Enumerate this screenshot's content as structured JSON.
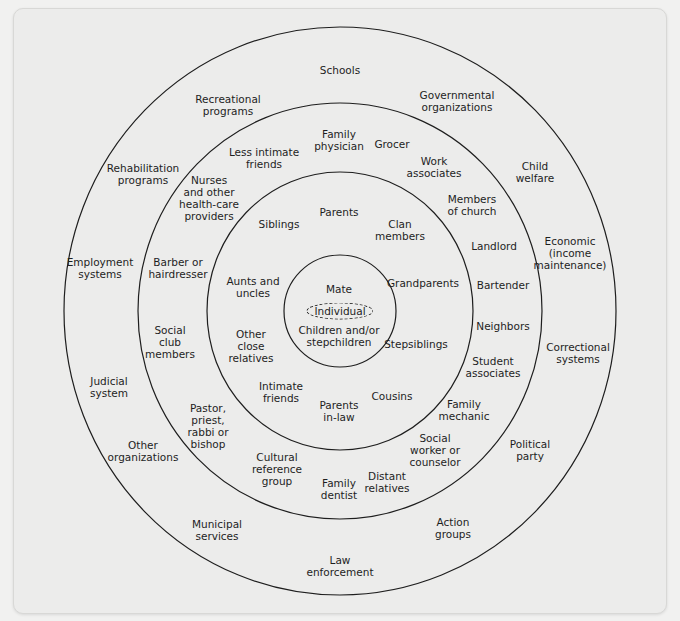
{
  "diagram": {
    "type": "concentric-circles",
    "center": {
      "x": 340,
      "y": 311
    },
    "rings": [
      {
        "name": "outer",
        "rx": 276,
        "ry": 284
      },
      {
        "name": "ring-3",
        "rx": 202,
        "ry": 208
      },
      {
        "name": "ring-2",
        "rx": 133,
        "ry": 139
      },
      {
        "name": "inner",
        "rx": 56,
        "ry": 56
      }
    ],
    "line_color": "#1e1e1e",
    "core": {
      "label": "Individual",
      "x": 340,
      "y": 311
    }
  },
  "labels": [
    {
      "id": "schools",
      "lines": [
        "Schools"
      ],
      "x": 340,
      "y": 70
    },
    {
      "id": "recreational-programs",
      "lines": [
        "Recreational",
        "programs"
      ],
      "x": 228,
      "y": 105
    },
    {
      "id": "governmental-organizations",
      "lines": [
        "Governmental",
        "organizations"
      ],
      "x": 457,
      "y": 101
    },
    {
      "id": "rehabilitation-programs",
      "lines": [
        "Rehabilitation",
        "programs"
      ],
      "x": 143,
      "y": 174
    },
    {
      "id": "child-welfare",
      "lines": [
        "Child",
        "welfare"
      ],
      "x": 535,
      "y": 172
    },
    {
      "id": "employment-systems",
      "lines": [
        "Employment",
        "systems"
      ],
      "x": 100,
      "y": 268
    },
    {
      "id": "economic",
      "lines": [
        "Economic",
        "(income",
        "maintenance)"
      ],
      "x": 570,
      "y": 253
    },
    {
      "id": "judicial-system",
      "lines": [
        "Judicial",
        "system"
      ],
      "x": 109,
      "y": 387
    },
    {
      "id": "correctional-systems",
      "lines": [
        "Correctional",
        "systems"
      ],
      "x": 578,
      "y": 353
    },
    {
      "id": "other-organizations",
      "lines": [
        "Other",
        "organizations"
      ],
      "x": 143,
      "y": 451
    },
    {
      "id": "political-party",
      "lines": [
        "Political",
        "party"
      ],
      "x": 530,
      "y": 450
    },
    {
      "id": "municipal-services",
      "lines": [
        "Municipal",
        "services"
      ],
      "x": 217,
      "y": 530
    },
    {
      "id": "action-groups",
      "lines": [
        "Action",
        "groups"
      ],
      "x": 453,
      "y": 528
    },
    {
      "id": "law-enforcement",
      "lines": [
        "Law",
        "enforcement"
      ],
      "x": 340,
      "y": 566
    },
    {
      "id": "family-physician",
      "lines": [
        "Family",
        "physician"
      ],
      "x": 339,
      "y": 140
    },
    {
      "id": "grocer",
      "lines": [
        "Grocer"
      ],
      "x": 392,
      "y": 144
    },
    {
      "id": "less-intimate-friends",
      "lines": [
        "Less intimate",
        "friends"
      ],
      "x": 264,
      "y": 158
    },
    {
      "id": "work-associates",
      "lines": [
        "Work",
        "associates"
      ],
      "x": 434,
      "y": 167
    },
    {
      "id": "nurses",
      "lines": [
        "Nurses",
        "and other",
        "health-care",
        "providers"
      ],
      "x": 209,
      "y": 198
    },
    {
      "id": "members-of-church",
      "lines": [
        "Members",
        "of church"
      ],
      "x": 472,
      "y": 205
    },
    {
      "id": "landlord",
      "lines": [
        "Landlord"
      ],
      "x": 494,
      "y": 246
    },
    {
      "id": "barber",
      "lines": [
        "Barber or",
        "hairdresser"
      ],
      "x": 178,
      "y": 268
    },
    {
      "id": "bartender",
      "lines": [
        "Bartender"
      ],
      "x": 503,
      "y": 285
    },
    {
      "id": "neighbors",
      "lines": [
        "Neighbors"
      ],
      "x": 503,
      "y": 326
    },
    {
      "id": "social-club-members",
      "lines": [
        "Social",
        "club",
        "members"
      ],
      "x": 170,
      "y": 342
    },
    {
      "id": "student-associates",
      "lines": [
        "Student",
        "associates"
      ],
      "x": 493,
      "y": 367
    },
    {
      "id": "pastor",
      "lines": [
        "Pastor,",
        "priest,",
        "rabbi or",
        "bishop"
      ],
      "x": 208,
      "y": 426
    },
    {
      "id": "family-mechanic",
      "lines": [
        "Family",
        "mechanic"
      ],
      "x": 464,
      "y": 410
    },
    {
      "id": "social-worker",
      "lines": [
        "Social",
        "worker or",
        "counselor"
      ],
      "x": 435,
      "y": 450
    },
    {
      "id": "cultural-reference-group",
      "lines": [
        "Cultural",
        "reference",
        "group"
      ],
      "x": 277,
      "y": 469
    },
    {
      "id": "distant-relatives",
      "lines": [
        "Distant",
        "relatives"
      ],
      "x": 387,
      "y": 482
    },
    {
      "id": "family-dentist",
      "lines": [
        "Family",
        "dentist"
      ],
      "x": 339,
      "y": 489
    },
    {
      "id": "parents",
      "lines": [
        "Parents"
      ],
      "x": 339,
      "y": 212
    },
    {
      "id": "siblings",
      "lines": [
        "Siblings"
      ],
      "x": 279,
      "y": 224
    },
    {
      "id": "clan-members",
      "lines": [
        "Clan",
        "members"
      ],
      "x": 400,
      "y": 230
    },
    {
      "id": "aunts-and-uncles",
      "lines": [
        "Aunts and",
        "uncles"
      ],
      "x": 253,
      "y": 287
    },
    {
      "id": "grandparents",
      "lines": [
        "Grandparents"
      ],
      "x": 423,
      "y": 283
    },
    {
      "id": "other-close-relatives",
      "lines": [
        "Other",
        "close",
        "relatives"
      ],
      "x": 251,
      "y": 346
    },
    {
      "id": "stepsiblings",
      "lines": [
        "Stepsiblings"
      ],
      "x": 416,
      "y": 344
    },
    {
      "id": "intimate-friends",
      "lines": [
        "Intimate",
        "friends"
      ],
      "x": 281,
      "y": 392
    },
    {
      "id": "cousins",
      "lines": [
        "Cousins"
      ],
      "x": 392,
      "y": 396
    },
    {
      "id": "parents-in-law",
      "lines": [
        "Parents",
        "in-law"
      ],
      "x": 339,
      "y": 411
    },
    {
      "id": "mate",
      "lines": [
        "Mate"
      ],
      "x": 339,
      "y": 289
    },
    {
      "id": "children",
      "lines": [
        "Children and/or",
        "stepchildren"
      ],
      "x": 339,
      "y": 336
    }
  ]
}
